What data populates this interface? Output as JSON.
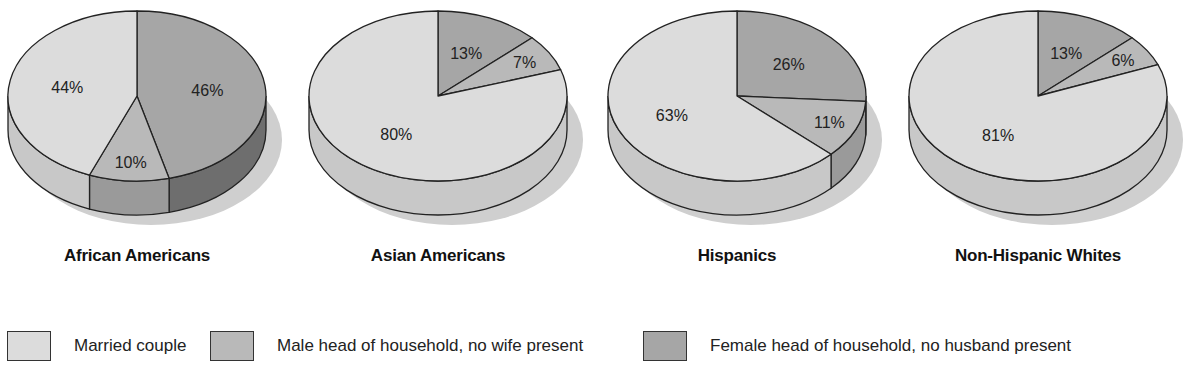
{
  "colors": {
    "married": "#dcdcdc",
    "male": "#b9b9b9",
    "female": "#a6a6a6",
    "married_side": "#c8c8c8",
    "male_side": "#9a9a9a",
    "female_side": "#6e6e6e",
    "shadow": "#cfcfcf",
    "outline": "#222222"
  },
  "legend": [
    {
      "key": "married",
      "label": "Married couple"
    },
    {
      "key": "male",
      "label": "Male head of household, no wife present"
    },
    {
      "key": "female",
      "label": "Female head of household, no husband present"
    }
  ],
  "pies": [
    {
      "title": "African Americans",
      "cx": 137,
      "slices": [
        {
          "key": "female",
          "value": 46,
          "label": "46%"
        },
        {
          "key": "male",
          "value": 10,
          "label": "10%"
        },
        {
          "key": "married",
          "value": 44,
          "label": "44%"
        }
      ]
    },
    {
      "title": "Asian Americans",
      "cx": 438,
      "slices": [
        {
          "key": "female",
          "value": 13,
          "label": "13%"
        },
        {
          "key": "male",
          "value": 7,
          "label": "7%"
        },
        {
          "key": "married",
          "value": 80,
          "label": "80%"
        }
      ]
    },
    {
      "title": "Hispanics",
      "cx": 737,
      "slices": [
        {
          "key": "female",
          "value": 26,
          "label": "26%"
        },
        {
          "key": "male",
          "value": 11,
          "label": "11%"
        },
        {
          "key": "married",
          "value": 63,
          "label": "63%"
        }
      ]
    },
    {
      "title": "Non-Hispanic Whites",
      "cx": 1038,
      "slices": [
        {
          "key": "female",
          "value": 13,
          "label": "13%"
        },
        {
          "key": "male",
          "value": 6,
          "label": "6%"
        },
        {
          "key": "married",
          "value": 81,
          "label": "81%"
        }
      ]
    }
  ],
  "chart_data": [
    {
      "type": "pie",
      "title": "African Americans",
      "categories": [
        "Married couple",
        "Male head of household, no wife present",
        "Female head of household, no husband present"
      ],
      "values": [
        44,
        10,
        46
      ]
    },
    {
      "type": "pie",
      "title": "Asian Americans",
      "categories": [
        "Married couple",
        "Male head of household, no wife present",
        "Female head of household, no husband present"
      ],
      "values": [
        80,
        7,
        13
      ]
    },
    {
      "type": "pie",
      "title": "Hispanics",
      "categories": [
        "Married couple",
        "Male head of household, no wife present",
        "Female head of household, no husband present"
      ],
      "values": [
        63,
        11,
        26
      ]
    },
    {
      "type": "pie",
      "title": "Non-Hispanic Whites",
      "categories": [
        "Married couple",
        "Male head of household, no wife present",
        "Female head of household, no husband present"
      ],
      "values": [
        81,
        6,
        13
      ]
    }
  ]
}
